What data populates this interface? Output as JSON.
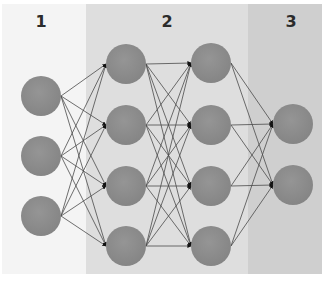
{
  "diagram": {
    "type": "neural-network",
    "sections": [
      {
        "label": "1",
        "color": "#f2f2f2"
      },
      {
        "label": "2",
        "color": "#dcdcdc"
      },
      {
        "label": "3",
        "color": "#cccccc"
      }
    ],
    "layers": [
      {
        "name": "input",
        "section": 0,
        "nodes": 3
      },
      {
        "name": "hidden-1",
        "section": 1,
        "nodes": 4
      },
      {
        "name": "hidden-2",
        "section": 1,
        "nodes": 4
      },
      {
        "name": "output",
        "section": 2,
        "nodes": 2
      }
    ],
    "connections": "fully-connected",
    "node_color": "#8c8c8c",
    "edge_color": "#4a4a4a",
    "arrow_color": "#111111"
  }
}
